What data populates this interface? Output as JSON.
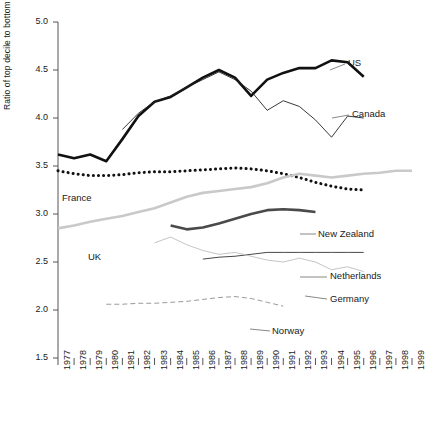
{
  "axes": {
    "ylabel": "Ratio of top decile to bottom decile",
    "yticks": [
      "5.0",
      "4.5",
      "4.0",
      "3.5",
      "3.0",
      "2.5",
      "2.0",
      "1.5"
    ],
    "xticks": [
      "1977",
      "1978",
      "1979",
      "1980",
      "1981",
      "1982",
      "1983",
      "1984",
      "1985",
      "1986",
      "1987",
      "1988",
      "1989",
      "1990",
      "1991",
      "1992",
      "1993",
      "1994",
      "1995",
      "1996",
      "1997",
      "1998",
      "1999"
    ]
  },
  "labels": {
    "us": "US",
    "canada": "Canada",
    "france": "France",
    "uk": "UK",
    "new_zealand": "New Zealand",
    "netherlands": "Netherlands",
    "germany": "Germany",
    "norway": "Norway"
  },
  "colors": {
    "us": "#111111",
    "canada": "#222222",
    "france": "#111111",
    "uk": "#c9c9c9",
    "new_zealand": "#4a4a4a",
    "netherlands": "#333333",
    "germany": "#bdbdbd",
    "norway": "#9a9a9a",
    "axis": "#555555",
    "text": "#1a1a1a"
  },
  "chart_data": {
    "type": "line",
    "title": "",
    "xlabel": "",
    "ylabel": "Ratio of top decile to bottom decile",
    "ylim": [
      1.5,
      5.0
    ],
    "xlim": [
      1977,
      1999
    ],
    "grid": false,
    "legend": "inline-labels",
    "x": [
      1977,
      1978,
      1979,
      1980,
      1981,
      1982,
      1983,
      1984,
      1985,
      1986,
      1987,
      1988,
      1989,
      1990,
      1991,
      1992,
      1993,
      1994,
      1995,
      1996,
      1997,
      1998,
      1999
    ],
    "series": [
      {
        "name": "US",
        "style": "solid-thick",
        "color": "#111111",
        "x": [
          1977,
          1978,
          1979,
          1980,
          1981,
          1982,
          1983,
          1984,
          1985,
          1986,
          1987,
          1988,
          1989,
          1990,
          1991,
          1992,
          1993,
          1994,
          1995,
          1996
        ],
        "values": [
          3.62,
          3.58,
          3.62,
          3.55,
          3.78,
          4.02,
          4.17,
          4.22,
          4.32,
          4.42,
          4.5,
          4.42,
          4.23,
          4.4,
          4.47,
          4.52,
          4.52,
          4.6,
          4.58,
          4.43
        ]
      },
      {
        "name": "Canada",
        "style": "solid-thin",
        "color": "#222222",
        "x": [
          1981,
          1982,
          1983,
          1984,
          1985,
          1986,
          1987,
          1988,
          1989,
          1990,
          1991,
          1992,
          1993,
          1994,
          1995,
          1996
        ],
        "values": [
          3.88,
          4.05,
          4.17,
          4.23,
          4.32,
          4.4,
          4.48,
          4.4,
          4.28,
          4.08,
          4.18,
          4.12,
          3.98,
          3.8,
          4.02,
          4.0
        ]
      },
      {
        "name": "France",
        "style": "dotted-thick",
        "color": "#111111",
        "x": [
          1977,
          1978,
          1979,
          1980,
          1981,
          1982,
          1983,
          1984,
          1985,
          1986,
          1987,
          1988,
          1989,
          1990,
          1991,
          1992,
          1993,
          1994,
          1995,
          1996
        ],
        "values": [
          3.45,
          3.42,
          3.4,
          3.4,
          3.41,
          3.43,
          3.44,
          3.44,
          3.45,
          3.46,
          3.47,
          3.48,
          3.47,
          3.45,
          3.42,
          3.38,
          3.33,
          3.29,
          3.26,
          3.25
        ]
      },
      {
        "name": "UK",
        "style": "solid-thick",
        "color": "#c9c9c9",
        "x": [
          1977,
          1978,
          1979,
          1980,
          1981,
          1982,
          1983,
          1984,
          1985,
          1986,
          1987,
          1988,
          1989,
          1990,
          1991,
          1992,
          1993,
          1994,
          1995,
          1996,
          1997,
          1998,
          1999
        ],
        "values": [
          2.85,
          2.88,
          2.92,
          2.95,
          2.98,
          3.02,
          3.06,
          3.12,
          3.18,
          3.22,
          3.24,
          3.26,
          3.28,
          3.32,
          3.38,
          3.42,
          3.4,
          3.38,
          3.4,
          3.42,
          3.43,
          3.45,
          3.45
        ]
      },
      {
        "name": "New Zealand",
        "style": "solid-thick",
        "color": "#4a4a4a",
        "x": [
          1984,
          1985,
          1986,
          1987,
          1988,
          1989,
          1990,
          1991,
          1992,
          1993
        ],
        "values": [
          2.88,
          2.84,
          2.86,
          2.9,
          2.95,
          3.0,
          3.04,
          3.05,
          3.04,
          3.02
        ]
      },
      {
        "name": "Netherlands",
        "style": "solid-thin",
        "color": "#333333",
        "x": [
          1986,
          1987,
          1988,
          1989,
          1990,
          1991,
          1992,
          1993,
          1994,
          1995,
          1996
        ],
        "values": [
          2.53,
          2.55,
          2.56,
          2.58,
          2.6,
          2.6,
          2.6,
          2.6,
          2.6,
          2.6,
          2.6
        ]
      },
      {
        "name": "Germany",
        "style": "solid-thin",
        "color": "#bdbdbd",
        "x": [
          1983,
          1984,
          1985,
          1986,
          1987,
          1988,
          1989,
          1990,
          1991,
          1992,
          1993,
          1994,
          1995,
          1996
        ],
        "values": [
          2.7,
          2.76,
          2.68,
          2.62,
          2.58,
          2.6,
          2.56,
          2.52,
          2.5,
          2.54,
          2.5,
          2.42,
          2.45,
          2.4
        ]
      },
      {
        "name": "Norway",
        "style": "dashed-thin",
        "color": "#9a9a9a",
        "x": [
          1980,
          1981,
          1982,
          1983,
          1984,
          1985,
          1986,
          1987,
          1988,
          1989,
          1990,
          1991
        ],
        "values": [
          2.06,
          2.06,
          2.07,
          2.07,
          2.08,
          2.09,
          2.11,
          2.13,
          2.14,
          2.12,
          2.08,
          2.04
        ]
      }
    ]
  }
}
